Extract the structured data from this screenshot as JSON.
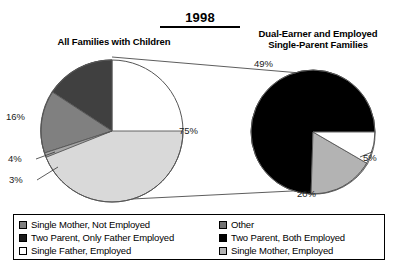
{
  "title": "1998",
  "panels": {
    "left": {
      "title": "All Families with Children"
    },
    "right": {
      "title_line1": "Dual-Earner and Employed",
      "title_line2": "Single-Parent Families"
    }
  },
  "labels": {
    "pct_75": "75%",
    "pct_16": "16%",
    "pct_4": "4%",
    "pct_3": "3%",
    "pct_49": "49%",
    "pct_5": "5%",
    "pct_20": "20%"
  },
  "legend": {
    "left_column": [
      {
        "label": "Single Mother, Not Employed",
        "color": "#808080"
      },
      {
        "label": "Two Parent, Only Father Employed",
        "color": "#1a1a1a"
      },
      {
        "label": "Single Father, Employed",
        "color": "#ffffff"
      }
    ],
    "right_column": [
      {
        "label": "Other",
        "color": "#737373"
      },
      {
        "label": "Two Parent, Both Employed",
        "color": "#000000"
      },
      {
        "label": "Single Mother, Employed",
        "color": "#b3b3b3"
      }
    ]
  },
  "chart_data": [
    {
      "type": "pie",
      "title": "All Families with Children",
      "categories": [
        "Other",
        "Two Parent, Only Father Employed",
        "Single Mother, Not Employed",
        "Single Father, Employed"
      ],
      "values": [
        75,
        16,
        4,
        3
      ],
      "labels": [
        "75%",
        "16%",
        "4%",
        "3%"
      ],
      "colors": [
        "#d9d9d9",
        "#404040",
        "#808080",
        "#a6a6a6"
      ],
      "legend_position": "bottom"
    },
    {
      "type": "pie",
      "title": "Dual-Earner and Employed Single-Parent Families",
      "categories": [
        "Two Parent, Both Employed",
        "Single Mother, Employed",
        "Single Father, Employed"
      ],
      "values": [
        49,
        20,
        5
      ],
      "labels": [
        "49%",
        "20%",
        "5%"
      ],
      "colors": [
        "#000000",
        "#b3b3b3",
        "#ffffff"
      ],
      "legend_position": "bottom",
      "note": "Exploded detail of the 75% slice of the left pie"
    }
  ]
}
